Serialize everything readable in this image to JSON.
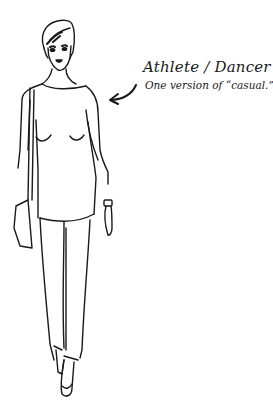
{
  "illustration": {
    "subject": "woman-full-figure-line-drawing",
    "stroke_color": "#1a1a1a",
    "background": "#ffffff"
  },
  "caption": {
    "title": "Athlete / Dancer",
    "subtitle": "One version of “casual.”"
  },
  "pointer": {
    "icon": "curved-arrow-left-icon"
  }
}
